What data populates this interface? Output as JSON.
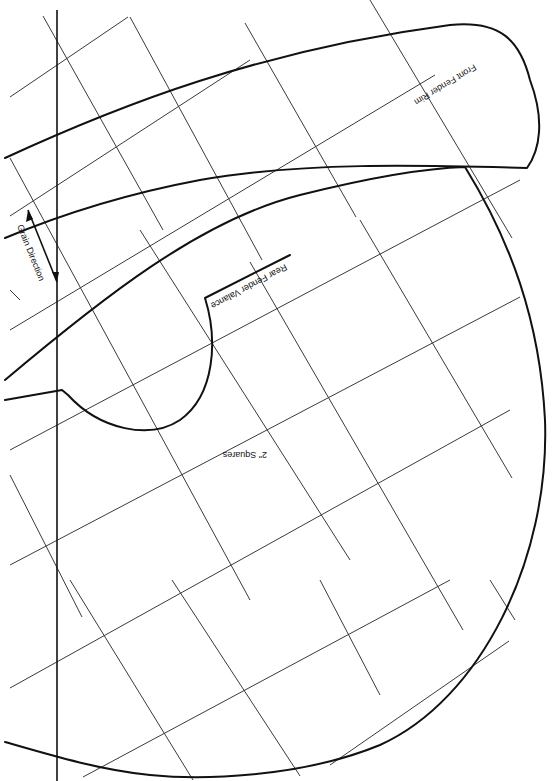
{
  "diagram": {
    "kind": "sewing pattern with grid",
    "background": "#ffffff",
    "ink_color": "#111111",
    "grid_color": "#3a3a3a",
    "grid_label": "2\" Squares",
    "pieces": [
      {
        "name": "front-fender-rim",
        "label": "Front Fender Rim"
      },
      {
        "name": "rear-fender-valance",
        "label": "Rear Fender Valance"
      }
    ],
    "grain": {
      "label": "Grain Direction"
    }
  },
  "labels": {
    "front_fender_rim": "Front Fender Rim",
    "rear_fender_valance": "Rear Fender Valance",
    "grain_direction": "Grain Direction",
    "grid_scale": "2\" Squares"
  },
  "geometry": {
    "grid_lines": [
      [
        43,
        16,
        163,
        230
      ],
      [
        130,
        17,
        262,
        260
      ],
      [
        245,
        23,
        356,
        217
      ],
      [
        370,
        0,
        512,
        238
      ],
      [
        10,
        158,
        250,
        600
      ],
      [
        140,
        230,
        350,
        560
      ],
      [
        250,
        262,
        463,
        630
      ],
      [
        360,
        220,
        512,
        478
      ],
      [
        10,
        475,
        82,
        617
      ],
      [
        10,
        290,
        20,
        300
      ],
      [
        70,
        580,
        193,
        780
      ],
      [
        172,
        580,
        300,
        776
      ],
      [
        320,
        580,
        380,
        695
      ],
      [
        490,
        580,
        515,
        620
      ],
      [
        10,
        97,
        128,
        17
      ],
      [
        10,
        216,
        250,
        60
      ],
      [
        10,
        330,
        435,
        75
      ],
      [
        10,
        450,
        520,
        180
      ],
      [
        10,
        565,
        520,
        297
      ],
      [
        10,
        688,
        510,
        410
      ],
      [
        83,
        777,
        450,
        580
      ],
      [
        330,
        765,
        509,
        641
      ]
    ],
    "grain_line": [
      57,
      10,
      57,
      781
    ],
    "grain_arrow": [
      28,
      210,
      57,
      282
    ],
    "front_fender_rim_path": "M 5 158 C 120 105, 260 50, 450 25 C 500 20, 520 40, 530 80 C 545 120, 540 150, 527 168 C 420 165, 300 162, 200 180 C 120 195, 60 215, 5 238",
    "rear_fender_valance_path": "M 5 380 C 100 300, 200 220, 300 195 C 380 175, 430 168, 465 167 C 510 240, 540 320, 545 420 C 550 560, 480 700, 380 745 C 300 778, 200 780, 150 775 C 100 770, 50 755, 5 742",
    "wheel_arch_path": "M 5 400 L 62 390 L 68 395 C 100 430, 150 440, 180 420 C 215 395, 218 340, 205 298 L 290 255"
  }
}
